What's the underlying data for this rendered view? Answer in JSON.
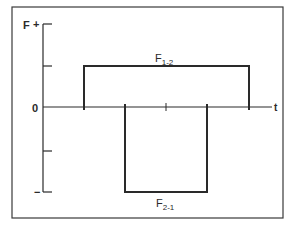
{
  "diagram": {
    "y_axis": {
      "label": "F",
      "positive_sign": "+",
      "negative_sign": "−",
      "zero_label": "0"
    },
    "x_axis": {
      "label": "t"
    },
    "pulses": [
      {
        "name": "F_1-2",
        "label_main": "F",
        "label_sub": "1-2",
        "sign": "positive"
      },
      {
        "name": "F_2-1",
        "label_main": "F",
        "label_sub": "2-1",
        "sign": "negative"
      }
    ],
    "colors": {
      "line": "#2a2a2a",
      "frame": "#3a3a3a",
      "background": "#ffffff"
    }
  }
}
